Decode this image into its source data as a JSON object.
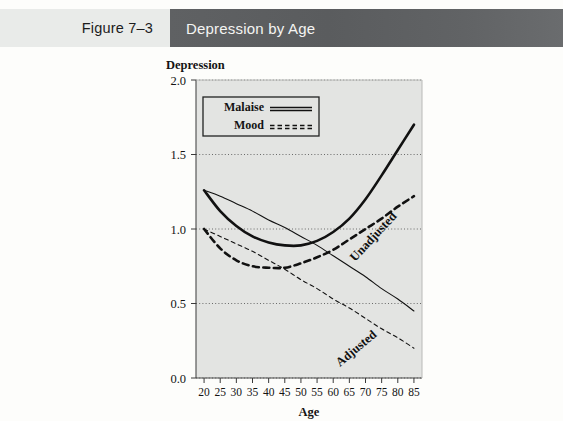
{
  "header": {
    "figure_label": "Figure 7–3",
    "title": "Depression by Age",
    "label_bg": "#e9ebe9",
    "title_bg": "#5f6163",
    "title_color": "#f4f4f2"
  },
  "legend": {
    "items": [
      {
        "label": "Malaise",
        "style": "solid"
      },
      {
        "label": "Mood",
        "style": "dashed"
      }
    ]
  },
  "annotations": {
    "unadjusted": "Unadjusted",
    "adjusted": "Adjusted"
  },
  "chart_data": {
    "type": "line",
    "title": "Depression by Age",
    "xlabel": "Age",
    "ylabel": "Depression",
    "xlim": [
      17.5,
      87.5
    ],
    "ylim": [
      0.0,
      2.0
    ],
    "grid": true,
    "grid_style": "dotted-horizontal",
    "legend_position": "top-left-inside",
    "plot_bg": "#e3e4e2",
    "line_color": "#111111",
    "x_ticks": [
      20,
      25,
      30,
      35,
      40,
      45,
      50,
      55,
      60,
      65,
      70,
      75,
      80,
      85
    ],
    "y_ticks": [
      0.0,
      0.5,
      1.0,
      1.5,
      2.0
    ],
    "y_tick_labels": [
      "0.0",
      "0.5",
      "1.0",
      "1.5",
      "2.0"
    ],
    "x": [
      20,
      25,
      30,
      35,
      40,
      45,
      50,
      55,
      60,
      65,
      70,
      75,
      80,
      85
    ],
    "series": [
      {
        "name": "Malaise, Unadjusted",
        "measure": "Malaise",
        "model": "Unadjusted",
        "style": "solid",
        "width": "thick",
        "values": [
          1.26,
          1.12,
          1.02,
          0.95,
          0.91,
          0.89,
          0.89,
          0.92,
          0.98,
          1.07,
          1.2,
          1.36,
          1.53,
          1.7
        ]
      },
      {
        "name": "Mood, Unadjusted",
        "measure": "Mood",
        "model": "Unadjusted",
        "style": "dashed",
        "width": "thick",
        "values": [
          1.0,
          0.87,
          0.79,
          0.75,
          0.74,
          0.74,
          0.77,
          0.81,
          0.86,
          0.93,
          1.0,
          1.07,
          1.15,
          1.22
        ]
      },
      {
        "name": "Malaise, Adjusted",
        "measure": "Malaise",
        "model": "Adjusted",
        "style": "solid",
        "width": "thin",
        "values": [
          1.26,
          1.22,
          1.17,
          1.12,
          1.06,
          1.01,
          0.95,
          0.89,
          0.82,
          0.75,
          0.68,
          0.6,
          0.53,
          0.45
        ]
      },
      {
        "name": "Mood, Adjusted",
        "measure": "Mood",
        "model": "Adjusted",
        "style": "dashed",
        "width": "thin",
        "values": [
          1.0,
          0.95,
          0.9,
          0.85,
          0.79,
          0.73,
          0.66,
          0.6,
          0.53,
          0.47,
          0.4,
          0.33,
          0.27,
          0.2
        ]
      }
    ]
  }
}
